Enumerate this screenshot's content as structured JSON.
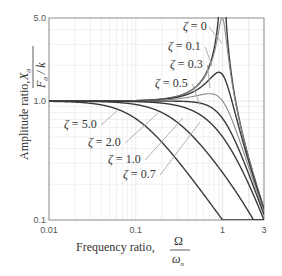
{
  "chart_data": {
    "type": "line",
    "title": "",
    "xlabel": "Frequency ratio, Ω/ω_n",
    "ylabel": "Amplitude ratio, X0/(F0/k)",
    "xscale": "log",
    "yscale": "log",
    "xlim": [
      0.01,
      3
    ],
    "ylim": [
      0.1,
      5.0
    ],
    "grid": true,
    "legend": "inline labels with leader lines",
    "x_ticks": [
      "0.01",
      "0.1",
      "1",
      "3"
    ],
    "y_ticks": [
      "0.1",
      "1.0",
      "5.0"
    ],
    "formula": "X0/(F0/k) = 1 / sqrt((1 - r^2)^2 + (2*zeta*r)^2)",
    "x": [
      0.01,
      0.02,
      0.05,
      0.1,
      0.2,
      0.3,
      0.5,
      0.7,
      0.8,
      0.9,
      1.0,
      1.2,
      1.5,
      2.0,
      3.0
    ],
    "series": [
      {
        "name": "ζ = 0",
        "zeta": 0.0,
        "values": [
          1.0,
          1.0,
          1.003,
          1.01,
          1.042,
          1.099,
          1.333,
          1.961,
          2.778,
          5.263,
          5.0,
          2.273,
          0.8,
          0.333,
          0.125
        ]
      },
      {
        "name": "ζ = 0.1",
        "zeta": 0.1,
        "values": [
          1.0,
          1.0,
          1.002,
          1.01,
          1.04,
          1.093,
          1.311,
          1.841,
          2.436,
          3.75,
          5.0,
          2.11,
          0.78,
          0.331,
          0.125
        ]
      },
      {
        "name": "ζ = 0.3",
        "zeta": 0.3,
        "values": [
          1.0,
          1.0,
          1.001,
          1.006,
          1.025,
          1.051,
          1.191,
          1.402,
          1.538,
          1.647,
          1.667,
          1.36,
          0.7,
          0.314,
          0.123
        ]
      },
      {
        "name": "ζ = 0.5",
        "zeta": 0.5,
        "values": [
          1.0,
          1.0,
          1.0,
          1.0,
          1.0,
          0.996,
          1.109,
          1.155,
          1.14,
          1.087,
          1.0,
          0.782,
          0.512,
          0.277,
          0.117
        ]
      },
      {
        "name": "ζ = 0.7",
        "zeta": 0.7,
        "values": [
          1.0,
          1.0,
          0.998,
          0.99,
          0.96,
          0.918,
          0.87,
          0.829,
          0.817,
          0.78,
          0.714,
          0.59,
          0.418,
          0.247,
          0.11
        ]
      },
      {
        "name": "ζ = 1.0",
        "zeta": 1.0,
        "values": [
          1.0,
          1.0,
          0.998,
          0.99,
          0.962,
          0.917,
          0.8,
          0.671,
          0.61,
          0.552,
          0.5,
          0.41,
          0.308,
          0.2,
          0.1
        ]
      },
      {
        "name": "ζ = 2.0",
        "zeta": 2.0,
        "values": [
          1.0,
          0.999,
          0.99,
          0.962,
          0.862,
          0.746,
          0.552,
          0.398,
          0.345,
          0.302,
          0.25,
          0.202,
          0.155,
          0.118,
          0.075
        ]
      },
      {
        "name": "ζ = 5.0",
        "zeta": 5.0,
        "values": [
          0.995,
          0.981,
          0.894,
          0.707,
          0.447,
          0.316,
          0.196,
          0.141,
          0.124,
          0.11,
          0.1,
          0.083,
          0.066,
          0.049,
          0.032
        ]
      }
    ]
  },
  "labels": {
    "xaxis_prefix": "Frequency ratio,",
    "xaxis_num": "Ω",
    "xaxis_den": "ω",
    "xaxis_den_sub": "n",
    "yaxis_prefix": "Amplitude ratio,",
    "yaxis_num": "X",
    "yaxis_num_sub": "0",
    "yaxis_den": "F",
    "yaxis_den_sub": "0",
    "yaxis_den_tail": " / k"
  },
  "zeta_labels": [
    {
      "text": "ζ = 0",
      "zeta": 0.0,
      "lx": 183,
      "ly": 30,
      "ax": 222,
      "ay": 43
    },
    {
      "text": "ζ = 0.1",
      "zeta": 0.1,
      "lx": 168,
      "ly": 50,
      "ax": 212,
      "ay": 66
    },
    {
      "text": "ζ = 0.3",
      "zeta": 0.3,
      "lx": 170,
      "ly": 68,
      "ax": 210,
      "ay": 88
    },
    {
      "text": "ζ = 0.5",
      "zeta": 0.5,
      "lx": 155,
      "ly": 87,
      "ax": 200,
      "ay": 105
    },
    {
      "text": "ζ = 5.0",
      "zeta": 5.0,
      "lx": 64,
      "ly": 128,
      "ax": 117,
      "ay": 111
    },
    {
      "text": "ζ = 2.0",
      "zeta": 2.0,
      "lx": 88,
      "ly": 146,
      "ax": 158,
      "ay": 113
    },
    {
      "text": "ζ = 1.0",
      "zeta": 1.0,
      "lx": 108,
      "ly": 163,
      "ax": 183,
      "ay": 118
    },
    {
      "text": "ζ = 0.7",
      "zeta": 0.7,
      "lx": 123,
      "ly": 178,
      "ax": 200,
      "ay": 122
    }
  ],
  "colors": {
    "curve_dark": "#3a3a3a",
    "curve_light": "#8a8a8a",
    "leader": "#a8a8a8",
    "grid": "#e2e2e2",
    "axis": "#7a7a7a"
  }
}
